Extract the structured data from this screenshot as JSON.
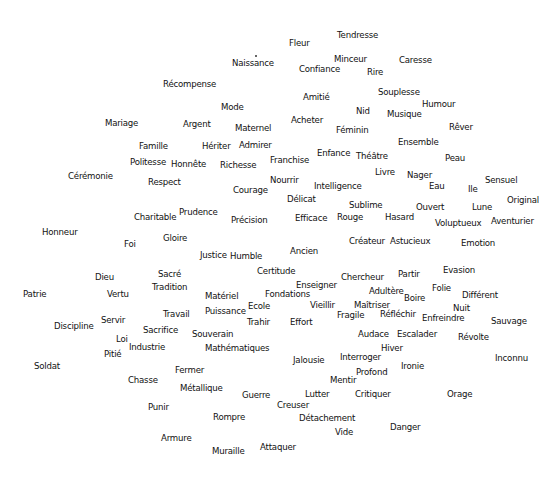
{
  "diagram": {
    "type": "word-map",
    "background": "#ffffff",
    "text_color": "#111111",
    "marker": {
      "x": 255,
      "y": 55
    },
    "words": [
      {
        "text": "Tendresse",
        "x": 337,
        "y": 35
      },
      {
        "text": "Fleur",
        "x": 289,
        "y": 43
      },
      {
        "text": "Minceur",
        "x": 334,
        "y": 59
      },
      {
        "text": "Caresse",
        "x": 399,
        "y": 60
      },
      {
        "text": "Naissance",
        "x": 232,
        "y": 63
      },
      {
        "text": "Confiance",
        "x": 299,
        "y": 69
      },
      {
        "text": "Rire",
        "x": 367,
        "y": 72
      },
      {
        "text": "Récompense",
        "x": 163,
        "y": 84
      },
      {
        "text": "Souplesse",
        "x": 378,
        "y": 92
      },
      {
        "text": "Amitié",
        "x": 303,
        "y": 97
      },
      {
        "text": "Humour",
        "x": 422,
        "y": 104
      },
      {
        "text": "Mode",
        "x": 221,
        "y": 107
      },
      {
        "text": "Nid",
        "x": 356,
        "y": 111
      },
      {
        "text": "Musique",
        "x": 387,
        "y": 114
      },
      {
        "text": "Mariage",
        "x": 105,
        "y": 123
      },
      {
        "text": "Argent",
        "x": 183,
        "y": 124
      },
      {
        "text": "Acheter",
        "x": 291,
        "y": 120
      },
      {
        "text": "Maternel",
        "x": 235,
        "y": 128
      },
      {
        "text": "Rêver",
        "x": 449,
        "y": 127
      },
      {
        "text": "Féminin",
        "x": 336,
        "y": 130
      },
      {
        "text": "Ensemble",
        "x": 398,
        "y": 142
      },
      {
        "text": "Famille",
        "x": 139,
        "y": 146
      },
      {
        "text": "Hériter",
        "x": 202,
        "y": 146
      },
      {
        "text": "Admirer",
        "x": 239,
        "y": 145
      },
      {
        "text": "Enfance",
        "x": 317,
        "y": 153
      },
      {
        "text": "Théâtre",
        "x": 356,
        "y": 156
      },
      {
        "text": "Peau",
        "x": 445,
        "y": 158
      },
      {
        "text": "Politesse",
        "x": 130,
        "y": 162
      },
      {
        "text": "Honnête",
        "x": 171,
        "y": 164
      },
      {
        "text": "Richesse",
        "x": 220,
        "y": 165
      },
      {
        "text": "Franchise",
        "x": 270,
        "y": 160
      },
      {
        "text": "Livre",
        "x": 375,
        "y": 172
      },
      {
        "text": "Nager",
        "x": 407,
        "y": 175
      },
      {
        "text": "Cérémonie",
        "x": 68,
        "y": 176
      },
      {
        "text": "Respect",
        "x": 148,
        "y": 182
      },
      {
        "text": "Nourrir",
        "x": 270,
        "y": 180
      },
      {
        "text": "Sensuel",
        "x": 485,
        "y": 180
      },
      {
        "text": "Intelligence",
        "x": 314,
        "y": 186
      },
      {
        "text": "Eau",
        "x": 429,
        "y": 186
      },
      {
        "text": "Ile",
        "x": 468,
        "y": 189
      },
      {
        "text": "Courage",
        "x": 233,
        "y": 190
      },
      {
        "text": "Délicat",
        "x": 287,
        "y": 199
      },
      {
        "text": "Original",
        "x": 507,
        "y": 200
      },
      {
        "text": "Sublime",
        "x": 349,
        "y": 205
      },
      {
        "text": "Ouvert",
        "x": 416,
        "y": 207
      },
      {
        "text": "Lune",
        "x": 472,
        "y": 207
      },
      {
        "text": "Prudence",
        "x": 179,
        "y": 212
      },
      {
        "text": "Charitable",
        "x": 134,
        "y": 217
      },
      {
        "text": "Efficace",
        "x": 295,
        "y": 218
      },
      {
        "text": "Rouge",
        "x": 337,
        "y": 217
      },
      {
        "text": "Hasard",
        "x": 385,
        "y": 217
      },
      {
        "text": "Précision",
        "x": 231,
        "y": 220
      },
      {
        "text": "Voluptueux",
        "x": 435,
        "y": 223
      },
      {
        "text": "Aventurier",
        "x": 491,
        "y": 221
      },
      {
        "text": "Honneur",
        "x": 42,
        "y": 232
      },
      {
        "text": "Gloire",
        "x": 163,
        "y": 238
      },
      {
        "text": "Créateur",
        "x": 349,
        "y": 241
      },
      {
        "text": "Astucieux",
        "x": 390,
        "y": 241
      },
      {
        "text": "Emotion",
        "x": 461,
        "y": 243
      },
      {
        "text": "Foi",
        "x": 124,
        "y": 244
      },
      {
        "text": "Ancien",
        "x": 290,
        "y": 251
      },
      {
        "text": "Justice",
        "x": 200,
        "y": 255
      },
      {
        "text": "Humble",
        "x": 230,
        "y": 256
      },
      {
        "text": "Certitude",
        "x": 257,
        "y": 271
      },
      {
        "text": "Evasion",
        "x": 443,
        "y": 270
      },
      {
        "text": "Sacré",
        "x": 158,
        "y": 274
      },
      {
        "text": "Partir",
        "x": 398,
        "y": 274
      },
      {
        "text": "Dieu",
        "x": 95,
        "y": 277
      },
      {
        "text": "Chercheur",
        "x": 341,
        "y": 277
      },
      {
        "text": "Tradition",
        "x": 152,
        "y": 287
      },
      {
        "text": "Enseigner",
        "x": 296,
        "y": 285
      },
      {
        "text": "Folie",
        "x": 432,
        "y": 288
      },
      {
        "text": "Adultère",
        "x": 369,
        "y": 291
      },
      {
        "text": "Matériel",
        "x": 205,
        "y": 296
      },
      {
        "text": "Fondations",
        "x": 265,
        "y": 294
      },
      {
        "text": "Patrie",
        "x": 23,
        "y": 294
      },
      {
        "text": "Vertu",
        "x": 107,
        "y": 294
      },
      {
        "text": "Boire",
        "x": 404,
        "y": 298
      },
      {
        "text": "Différent",
        "x": 462,
        "y": 295
      },
      {
        "text": "Ecole",
        "x": 248,
        "y": 306
      },
      {
        "text": "Vieillir",
        "x": 310,
        "y": 305
      },
      {
        "text": "Maîtriser",
        "x": 354,
        "y": 305
      },
      {
        "text": "Nuit",
        "x": 453,
        "y": 308
      },
      {
        "text": "Puissance",
        "x": 205,
        "y": 311
      },
      {
        "text": "Travail",
        "x": 163,
        "y": 314
      },
      {
        "text": "Fragile",
        "x": 337,
        "y": 315
      },
      {
        "text": "Réfléchir",
        "x": 380,
        "y": 314
      },
      {
        "text": "Enfreindre",
        "x": 422,
        "y": 318
      },
      {
        "text": "Servir",
        "x": 101,
        "y": 320
      },
      {
        "text": "Effort",
        "x": 290,
        "y": 322
      },
      {
        "text": "Sauvage",
        "x": 491,
        "y": 321
      },
      {
        "text": "Trahir",
        "x": 247,
        "y": 322
      },
      {
        "text": "Discipline",
        "x": 54,
        "y": 326
      },
      {
        "text": "Sacrifice",
        "x": 143,
        "y": 330
      },
      {
        "text": "Souverain",
        "x": 192,
        "y": 334
      },
      {
        "text": "Audace",
        "x": 358,
        "y": 334
      },
      {
        "text": "Escalader",
        "x": 397,
        "y": 334
      },
      {
        "text": "Révolte",
        "x": 458,
        "y": 337
      },
      {
        "text": "Loi",
        "x": 116,
        "y": 339
      },
      {
        "text": "Industrie",
        "x": 129,
        "y": 347
      },
      {
        "text": "Mathématiques",
        "x": 205,
        "y": 348
      },
      {
        "text": "Hiver",
        "x": 381,
        "y": 348
      },
      {
        "text": "Pitié",
        "x": 104,
        "y": 354
      },
      {
        "text": "Interroger",
        "x": 340,
        "y": 357
      },
      {
        "text": "Jalousie",
        "x": 293,
        "y": 360
      },
      {
        "text": "Inconnu",
        "x": 495,
        "y": 358
      },
      {
        "text": "Ironie",
        "x": 401,
        "y": 366
      },
      {
        "text": "Soldat",
        "x": 34,
        "y": 366
      },
      {
        "text": "Fermer",
        "x": 175,
        "y": 370
      },
      {
        "text": "Profond",
        "x": 356,
        "y": 372
      },
      {
        "text": "Chasse",
        "x": 128,
        "y": 380
      },
      {
        "text": "Mentir",
        "x": 330,
        "y": 380
      },
      {
        "text": "Métallique",
        "x": 180,
        "y": 388
      },
      {
        "text": "Guerre",
        "x": 242,
        "y": 395
      },
      {
        "text": "Lutter",
        "x": 305,
        "y": 394
      },
      {
        "text": "Critiquer",
        "x": 355,
        "y": 394
      },
      {
        "text": "Orage",
        "x": 447,
        "y": 394
      },
      {
        "text": "Punir",
        "x": 148,
        "y": 407
      },
      {
        "text": "Creuser",
        "x": 277,
        "y": 405
      },
      {
        "text": "Rompre",
        "x": 213,
        "y": 417
      },
      {
        "text": "Détachement",
        "x": 299,
        "y": 418
      },
      {
        "text": "Danger",
        "x": 390,
        "y": 427
      },
      {
        "text": "Vide",
        "x": 335,
        "y": 432
      },
      {
        "text": "Armure",
        "x": 161,
        "y": 438
      },
      {
        "text": "Attaquer",
        "x": 260,
        "y": 447
      },
      {
        "text": "Muraille",
        "x": 212,
        "y": 451
      }
    ]
  }
}
